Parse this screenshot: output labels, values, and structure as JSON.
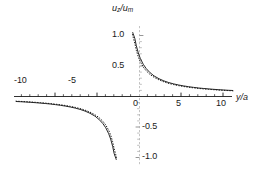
{
  "figure": {
    "background_color": "#ffffff",
    "curve_color": "#1a1a1a",
    "axis_color": "#1a1a1a",
    "yaxis_color": "#b8b8b8"
  },
  "axes": {
    "x_title_prefix": "y",
    "x_title_slash": "/",
    "x_title_suffix": "a",
    "x_title": "y/a",
    "y_title": "uz/um",
    "y_title_num_var": "u",
    "y_title_num_sub": "z",
    "y_title_slash": "/",
    "y_title_den_var": "u",
    "y_title_den_sub": "m",
    "xlim": [
      -11.2,
      10.9
    ],
    "ylim": [
      -1.16,
      1.16
    ],
    "x_ticks": [
      -10,
      -5,
      0,
      5,
      10
    ],
    "x_tick_labels": [
      "-10",
      "-5",
      "0",
      "5",
      "10"
    ],
    "y_ticks": [
      1.0,
      0.5,
      -0.5,
      -1.0
    ],
    "y_tick_labels": [
      "1.0",
      "0.5",
      "-0.5",
      "-1.0"
    ],
    "grid": false,
    "legend": "none"
  },
  "chart_data": {
    "type": "line",
    "title": "",
    "xlabel": "y/a",
    "ylabel": "uz/um",
    "xlim": [
      -11.2,
      10.9
    ],
    "ylim": [
      -1.16,
      1.16
    ],
    "grid": false,
    "legend_position": "none",
    "series": [
      {
        "name": "solid",
        "style": "solid",
        "color": "#1a1a1a",
        "x": [
          -11.0,
          -10.5,
          -10.0,
          -9.5,
          -9.0,
          -8.5,
          -8.0,
          -7.5,
          -7.0,
          -6.5,
          -6.0,
          -5.5,
          -5.0,
          -4.5,
          -4.0,
          -3.5,
          -3.0,
          -2.6,
          -2.2,
          -1.9,
          -1.6,
          -1.4,
          -1.2,
          -1.05,
          -0.95,
          -0.88,
          -0.84,
          -0.82
        ],
        "y": [
          -0.091,
          -0.095,
          -0.1,
          -0.105,
          -0.111,
          -0.118,
          -0.125,
          -0.133,
          -0.143,
          -0.154,
          -0.167,
          -0.182,
          -0.2,
          -0.222,
          -0.25,
          -0.286,
          -0.333,
          -0.385,
          -0.455,
          -0.526,
          -0.625,
          -0.714,
          -0.833,
          -0.952,
          -1.0,
          -1.03,
          -1.05,
          -1.06
        ]
      },
      {
        "name": "dotted",
        "style": "dotted",
        "color": "#1a1a1a",
        "x": [
          -11.0,
          -10.5,
          -10.0,
          -9.5,
          -9.0,
          -8.5,
          -8.0,
          -7.5,
          -7.0,
          -6.5,
          -6.0,
          -5.5,
          -5.0,
          -4.5,
          -4.0,
          -3.5,
          -3.0,
          -2.6,
          -2.2,
          -1.9,
          -1.6,
          -1.4,
          -1.2,
          -1.05,
          -0.95,
          -0.88,
          -0.84,
          -0.82
        ],
        "y": [
          -0.086,
          -0.09,
          -0.094,
          -0.099,
          -0.105,
          -0.111,
          -0.118,
          -0.126,
          -0.135,
          -0.145,
          -0.157,
          -0.171,
          -0.188,
          -0.208,
          -0.234,
          -0.267,
          -0.31,
          -0.355,
          -0.417,
          -0.48,
          -0.568,
          -0.648,
          -0.757,
          -0.872,
          -0.93,
          -0.975,
          -1.005,
          -1.025
        ]
      }
    ]
  }
}
